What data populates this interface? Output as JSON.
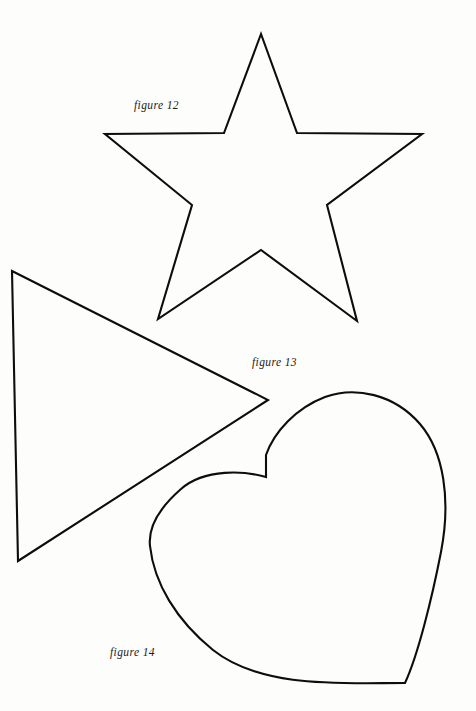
{
  "page": {
    "background_color": "#fdfdfb",
    "stroke_color": "#0d0d0d",
    "width": 476,
    "height": 711
  },
  "captions": {
    "figure_12": "figure 12",
    "figure_13": "figure 13",
    "figure_14": "figure 14"
  },
  "shapes": {
    "star": {
      "name": "five-pointed-star",
      "label": "figure 12",
      "points": "261,34 224,133 105,134 192,205 158,319 261,250 357,321 327,205 422,134 297,133"
    },
    "triangle": {
      "name": "right-pointing-triangle",
      "label": "figure 13",
      "points": "12,271 268,400 18,561"
    },
    "heart": {
      "name": "heart",
      "label": "figure 14",
      "path": "M 266,455 L 266,477 C 245,471 205,468 181,489 C 157,510 148,528 150,546 C 154,583 176,620 213,650 C 262,689 344,683 405,683 L 405,683 C 418,655 432,598 441,552 C 451,500 444,452 420,424 C 394,394 355,386 325,397 C 296,408 274,432 266,455 Z"
    }
  }
}
